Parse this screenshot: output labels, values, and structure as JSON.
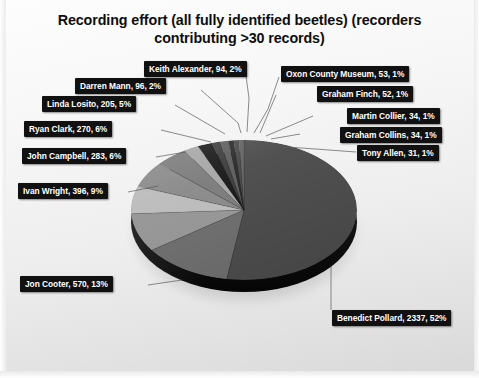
{
  "chart_data": {
    "type": "pie",
    "title": "Recording effort (all fully identified beetles) (recorders contributing >30 records)",
    "title_line1": "Recording effort (all fully identified beetles) (recorders",
    "title_line2": "contributing >30 records)",
    "xlabel": "",
    "ylabel": "",
    "legend_position": "none",
    "grid": false,
    "value_total": 4461,
    "categories": [
      "Benedict Pollard",
      "Jon Cooter",
      "Ivan Wright",
      "John Campbell",
      "Ryan Clark",
      "Linda Losito",
      "Darren Mann",
      "Keith Alexander",
      "Oxon County Museum",
      "Graham Finch",
      "Martin Collier",
      "Graham Collins",
      "Tony Allen"
    ],
    "values": [
      2337,
      570,
      396,
      283,
      270,
      205,
      96,
      94,
      53,
      52,
      34,
      34,
      31
    ],
    "percents": [
      52,
      13,
      9,
      6,
      6,
      5,
      2,
      2,
      1,
      1,
      1,
      1,
      1
    ],
    "slices": [
      {
        "name": "Benedict Pollard",
        "value": 2337,
        "percent": 52,
        "label": "Benedict Pollard, 2337, 52%",
        "color": "#4c4c4c"
      },
      {
        "name": "Jon Cooter",
        "value": 570,
        "percent": 13,
        "label": "Jon Cooter, 570, 13%",
        "color": "#6e6e6e"
      },
      {
        "name": "Ivan Wright",
        "value": 396,
        "percent": 9,
        "label": "Ivan Wright, 396, 9%",
        "color": "#969696"
      },
      {
        "name": "John Campbell",
        "value": 283,
        "percent": 6,
        "label": "John Campbell, 283, 6%",
        "color": "#bcbcbc"
      },
      {
        "name": "Ryan Clark",
        "value": 270,
        "percent": 6,
        "label": "Ryan Clark, 270, 6%",
        "color": "#8a8a8a"
      },
      {
        "name": "Linda Losito",
        "value": 205,
        "percent": 5,
        "label": "Linda Losito, 205, 5%",
        "color": "#7c7c7c"
      },
      {
        "name": "Darren Mann",
        "value": 96,
        "percent": 2,
        "label": "Darren Mann, 96, 2%",
        "color": "#a6a6a6"
      },
      {
        "name": "Keith Alexander",
        "value": 94,
        "percent": 2,
        "label": "Keith Alexander, 94, 2%",
        "color": "#1a1a1a"
      },
      {
        "name": "Oxon County Museum",
        "value": 53,
        "percent": 1,
        "label": "Oxon County Museum, 53, 1%",
        "color": "#3d3d3d"
      },
      {
        "name": "Graham Finch",
        "value": 52,
        "percent": 1,
        "label": "Graham Finch, 52, 1%",
        "color": "#5e5e5e"
      },
      {
        "name": "Martin Collier",
        "value": 34,
        "percent": 1,
        "label": "Martin Collier, 34, 1%",
        "color": "#2b2b2b"
      },
      {
        "name": "Graham Collins",
        "value": 34,
        "percent": 1,
        "label": "Graham Collins, 34, 1%",
        "color": "#4a4a4a"
      },
      {
        "name": "Tony Allen",
        "value": 31,
        "percent": 1,
        "label": "Tony Allen, 31, 1%",
        "color": "#636363"
      }
    ]
  },
  "labels": {
    "keith_alexander": "Keith Alexander, 94, 2%",
    "darren_mann": "Darren Mann, 96, 2%",
    "linda_losito": "Linda Losito, 205, 5%",
    "ryan_clark": "Ryan Clark, 270, 6%",
    "john_campbell": "John Campbell, 283, 6%",
    "ivan_wright": "Ivan Wright, 396, 9%",
    "jon_cooter": "Jon Cooter, 570, 13%",
    "benedict_pollard": "Benedict Pollard, 2337, 52%",
    "oxon_county_museum": "Oxon County Museum, 53, 1%",
    "graham_finch": "Graham Finch, 52, 1%",
    "martin_collier": "Martin Collier, 34, 1%",
    "graham_collins": "Graham Collins, 34, 1%",
    "tony_allen": "Tony Allen, 31, 1%"
  },
  "colors": {
    "label_background": "#111111",
    "label_text": "#ffffff",
    "title_text": "#0d0d0d",
    "background_top": "#fdfdfd",
    "background_bottom": "#d8d8d8",
    "pie_side": "#141414"
  }
}
